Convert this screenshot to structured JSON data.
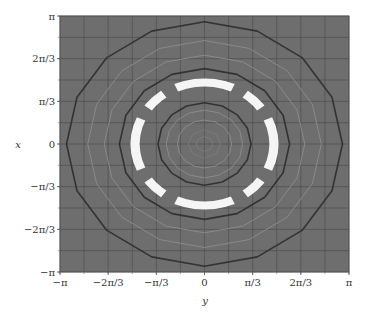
{
  "chart_data": {
    "type": "contour",
    "title": "",
    "xlabel": "y",
    "ylabel": "x",
    "xlim": [
      -3.14159,
      3.14159
    ],
    "ylim": [
      -3.14159,
      3.14159
    ],
    "grid": true,
    "grid_step": "π/6",
    "x_ticks": [
      "−π",
      "−2π/3",
      "−π/3",
      "0",
      "π/3",
      "2π/3",
      "π"
    ],
    "y_ticks": [
      "π",
      "2π/3",
      "π/3",
      "0",
      "−π/3",
      "−2π/3",
      "−π"
    ],
    "background_color": "#6e6e6e",
    "grid_color": "#4f4f4f",
    "contours": [
      {
        "radius": 3.0,
        "style": "dark",
        "color": "#333333"
      },
      {
        "radius": 2.54,
        "style": "light",
        "color": "#8a8a8a"
      },
      {
        "radius": 2.18,
        "style": "light",
        "color": "#8a8a8a"
      },
      {
        "radius": 1.85,
        "style": "dark",
        "color": "#333333"
      },
      {
        "radius": 1.01,
        "style": "dark",
        "color": "#333333"
      },
      {
        "radius": 0.83,
        "style": "light",
        "color": "#8a8a8a"
      },
      {
        "radius": 0.59,
        "style": "light",
        "color": "#8a8a8a"
      }
    ],
    "highlight_band": {
      "inner_radius": 1.41,
      "outer_radius": 1.61,
      "color": "#f5f5f5",
      "segments": 8
    },
    "center": [
      0,
      0
    ]
  }
}
